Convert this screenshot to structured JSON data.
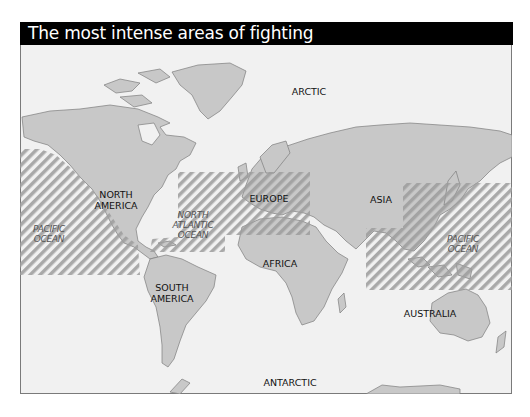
{
  "title": "The most intense areas of fighting",
  "colors": {
    "header_bg": "#000000",
    "header_text": "#ffffff",
    "sea": "#f1f1f1",
    "land": "#c8c8c8",
    "coast": "#7d7d7d",
    "hatch": "#9c9c9c"
  },
  "labels": {
    "arctic": "ARCTIC",
    "antarctic": "ANTARCTIC",
    "north_america_1": "NORTH",
    "north_america_2": "AMERICA",
    "south_america_1": "SOUTH",
    "south_america_2": "AMERICA",
    "europe": "EUROPE",
    "asia": "ASIA",
    "africa": "AFRICA",
    "australia": "AUSTRALIA",
    "pacific_west_1": "PACIFIC",
    "pacific_west_2": "OCEAN",
    "atlantic_1": "NORTH",
    "atlantic_2": "ATLANTIC",
    "atlantic_3": "OCEAN",
    "pacific_east_1": "PACIFIC",
    "pacific_east_2": "OCEAN"
  },
  "fighting_areas": [
    {
      "name": "Eastern Pacific",
      "pattern": "diagonal-hatch"
    },
    {
      "name": "North Atlantic & Europe",
      "pattern": "diagonal-hatch"
    },
    {
      "name": "Western Pacific & Southeast Asia",
      "pattern": "diagonal-hatch"
    }
  ]
}
